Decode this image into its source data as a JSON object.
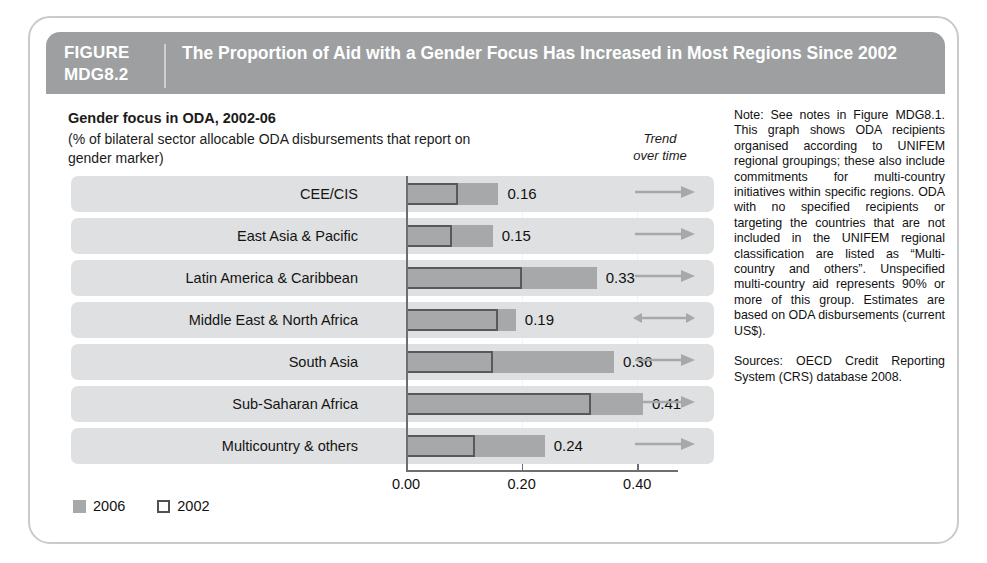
{
  "figure": {
    "label_line1": "FIGURE",
    "label_line2": "MDG8.2",
    "title": "The Proportion of Aid with a Gender Focus Has Increased in Most Regions Since 2002"
  },
  "chart": {
    "title": "Gender focus in ODA, 2002-06",
    "subtitle": "(% of bilateral sector allocable ODA disbursements that report on gender marker)",
    "trend_header_line1": "Trend",
    "trend_header_line2": "over time"
  },
  "legend": {
    "series_2006": "2006",
    "series_2002": "2002"
  },
  "notes": {
    "note": "Note: See notes in Figure MDG8.1. This graph shows ODA recipients organised according to UNIFEM regional groupings; these also include commitments for multi-country initiatives within specific regions. ODA with no specified recipients or targeting the countries that are not included in the UNIFEM regional classification are listed as “Multi-country and others”. Unspecified multi-country aid represents 90% or more of this group. Estimates are based on ODA disbursements (current US$).",
    "sources": "Sources: OECD Credit Reporting System (CRS) database 2008."
  },
  "colors": {
    "header_band": "#9d9fa1",
    "row_band": "#dfe0e1",
    "bar_2006": "#a6a8aa",
    "bar_2002_outline": "#58595b",
    "arrow": "#a6a8aa",
    "axis": "#6d6e70",
    "card_border": "#c9cacb"
  },
  "chart_data": {
    "type": "bar",
    "orientation": "horizontal",
    "title": "Gender focus in ODA, 2002-06",
    "subtitle": "(% of bilateral sector allocable ODA disbursements that report on gender marker)",
    "xlabel": "",
    "ylabel": "",
    "xlim": [
      0.0,
      0.47
    ],
    "xticks": [
      0.0,
      0.2,
      0.4
    ],
    "xticklabels": [
      "0.00",
      "0.20",
      "0.40"
    ],
    "grid": true,
    "legend_position": "bottom-left",
    "categories": [
      "CEE/CIS",
      "East Asia & Pacific",
      "Latin America & Caribbean",
      "Middle East & North Africa",
      "South Asia",
      "Sub-Saharan Africa",
      "Multicountry & others"
    ],
    "series": [
      {
        "name": "2006",
        "values": [
          0.16,
          0.15,
          0.33,
          0.19,
          0.36,
          0.41,
          0.24
        ],
        "labels": [
          "0.16",
          "0.15",
          "0.33",
          "0.19",
          "0.36",
          "0.41",
          "0.24"
        ]
      },
      {
        "name": "2002",
        "values": [
          0.09,
          0.08,
          0.2,
          0.16,
          0.15,
          0.32,
          0.12
        ],
        "labels": [
          "",
          "",
          "",
          "",
          "",
          "",
          ""
        ]
      }
    ],
    "annotations": {
      "trend_column_header": "Trend over time",
      "trend_over_time": [
        "increase",
        "increase",
        "increase",
        "no-change",
        "increase",
        "increase",
        "increase"
      ]
    }
  },
  "rows": [
    {
      "label": "CEE/CIS",
      "v2006": 0.16,
      "v2002": 0.09,
      "value_label": "0.16",
      "trend": "arrow-right-icon"
    },
    {
      "label": "East Asia & Pacific",
      "v2006": 0.15,
      "v2002": 0.08,
      "value_label": "0.15",
      "trend": "arrow-right-icon"
    },
    {
      "label": "Latin America & Caribbean",
      "v2006": 0.33,
      "v2002": 0.2,
      "value_label": "0.33",
      "trend": "arrow-right-icon"
    },
    {
      "label": "Middle East & North Africa",
      "v2006": 0.19,
      "v2002": 0.16,
      "value_label": "0.19",
      "trend": "arrow-bidirectional-icon"
    },
    {
      "label": "South Asia",
      "v2006": 0.36,
      "v2002": 0.15,
      "value_label": "0.36",
      "trend": "arrow-right-icon"
    },
    {
      "label": "Sub-Saharan Africa",
      "v2006": 0.41,
      "v2002": 0.32,
      "value_label": "0.41",
      "trend": "arrow-right-icon"
    },
    {
      "label": "Multicountry & others",
      "v2006": 0.24,
      "v2002": 0.12,
      "value_label": "0.24",
      "trend": "arrow-right-icon"
    }
  ]
}
